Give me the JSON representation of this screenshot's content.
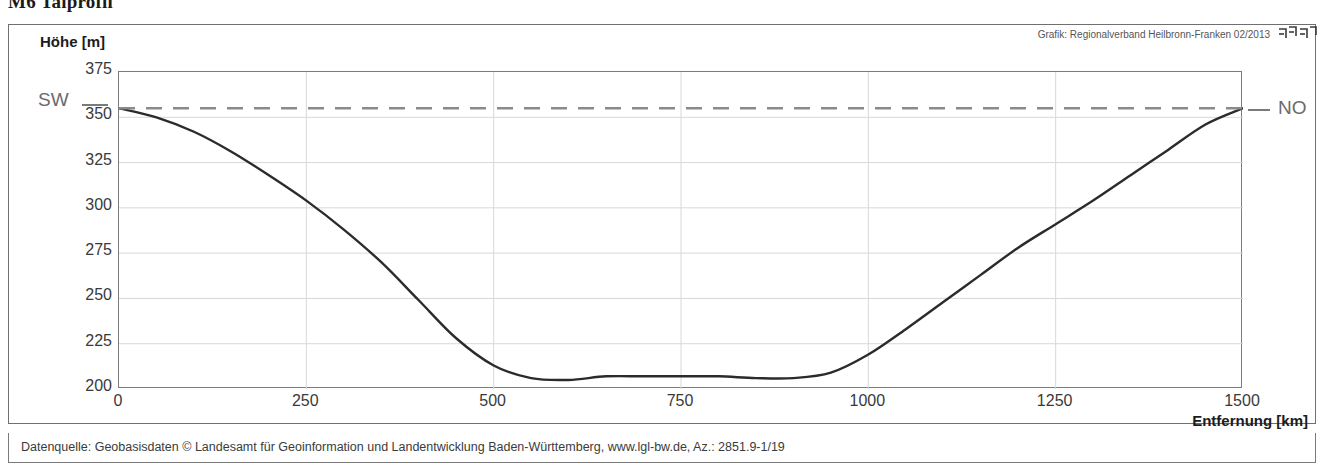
{
  "title": "M6 Talprofil",
  "credit": "Grafik: Regionalverband Heilbronn-Franken 02/2013",
  "logo_name": "regionalverband-heilbronn-franken-logo",
  "source_note": "Datenquelle: Geobasisdaten © Landesamt für Geoinformation und Landentwicklung Baden-Württemberg, www.lgl-bw.de, Az.: 2851.9-1/19",
  "direction_labels": {
    "start": "SW",
    "end": "NO"
  },
  "colors": {
    "curve": "#2b2b2b",
    "reference_line": "#8a8a8a",
    "grid": "#d8d8d8",
    "axis": "#7c7c7c",
    "text": "#3a3a3a"
  },
  "chart_data": {
    "type": "line",
    "title": "M6 Talprofil",
    "xlabel": "Entfernung [km]",
    "ylabel": "Höhe [m]",
    "xlim": [
      0,
      1500
    ],
    "ylim": [
      200,
      375
    ],
    "xticks": [
      0,
      250,
      500,
      750,
      1000,
      1250,
      1500
    ],
    "yticks": [
      200,
      225,
      250,
      275,
      300,
      325,
      350,
      375
    ],
    "grid": true,
    "legend": "none",
    "series": [
      {
        "name": "Geländeprofil",
        "style": "solid",
        "x": [
          0,
          50,
          100,
          150,
          200,
          250,
          300,
          350,
          400,
          450,
          500,
          550,
          600,
          650,
          700,
          750,
          800,
          850,
          900,
          950,
          1000,
          1050,
          1100,
          1150,
          1200,
          1250,
          1300,
          1350,
          1400,
          1450,
          1500
        ],
        "y": [
          355,
          350,
          342,
          331,
          318,
          304,
          288,
          270,
          249,
          228,
          213,
          206,
          205,
          207,
          207,
          207,
          207,
          206,
          206,
          209,
          219,
          233,
          248,
          263,
          278,
          291,
          304,
          318,
          332,
          346,
          355
        ]
      },
      {
        "name": "Referenzlinie",
        "style": "dashed",
        "x": [
          0,
          1500
        ],
        "y": [
          355,
          355
        ]
      }
    ],
    "annotations": [
      {
        "text": "SW",
        "position": "left-of-axis",
        "value": 355
      },
      {
        "text": "NO",
        "position": "right-of-axis",
        "value": 355
      }
    ]
  }
}
